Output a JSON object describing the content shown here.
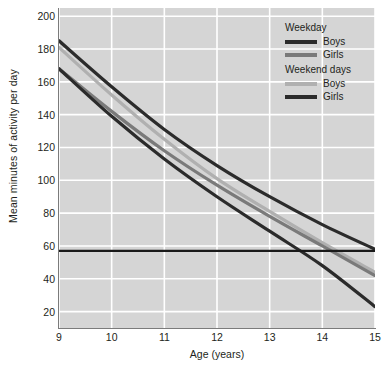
{
  "chart_data": {
    "type": "line",
    "title": "",
    "xlabel": "Age (years)",
    "ylabel": "Mean minutes of activity per day",
    "xlim": [
      9,
      15
    ],
    "ylim": [
      10,
      205
    ],
    "grid": true,
    "legend_position": "top-right",
    "x_ticks": [
      9,
      10,
      11,
      12,
      13,
      14,
      15
    ],
    "y_ticks": [
      20,
      40,
      60,
      80,
      100,
      120,
      140,
      160,
      180,
      200
    ],
    "x": [
      9,
      10,
      11,
      12,
      13,
      14,
      15
    ],
    "reference_line": {
      "label": "",
      "orientation": "horizontal",
      "value": 57,
      "color": "#1a1a1a"
    },
    "series": [
      {
        "name": "Weekday Boys",
        "group": "Weekday",
        "label": "Boys",
        "color": "#2b2b2b",
        "values": [
          185,
          157,
          131,
          109,
          90,
          73,
          58
        ]
      },
      {
        "name": "Weekend days Boys",
        "group": "Weekend days",
        "label": "Boys",
        "color": "#b0b0b0",
        "values": [
          181,
          152,
          125,
          101,
          81,
          62,
          44
        ]
      },
      {
        "name": "Weekday Girls",
        "group": "Weekday",
        "label": "Girls",
        "color": "#7a7a7a",
        "values": [
          168,
          142,
          118,
          97,
          78,
          60,
          42
        ]
      },
      {
        "name": "Weekend days Girls",
        "group": "Weekend days",
        "label": "Girls",
        "color": "#2b2b2b",
        "values": [
          168,
          139,
          113,
          90,
          69,
          48,
          23
        ]
      }
    ]
  },
  "legend": {
    "groups": [
      {
        "title": "Weekday",
        "entries": [
          {
            "label": "Boys",
            "color": "#2b2b2b"
          },
          {
            "label": "Girls",
            "color": "#7a7a7a"
          }
        ]
      },
      {
        "title": "Weekend days",
        "entries": [
          {
            "label": "Boys",
            "color": "#b0b0b0"
          },
          {
            "label": "Girls",
            "color": "#2b2b2b"
          }
        ]
      }
    ]
  },
  "style": {
    "plot_background": "#d5d5d5",
    "gridline_color": "#ffffff",
    "axis_color": "#7b7b7b",
    "text_color": "#231f20",
    "page_background": "#ffffff"
  }
}
